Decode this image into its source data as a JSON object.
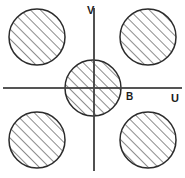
{
  "figure": {
    "background_color": "#ffffff",
    "ink_color": "#2b2b2b",
    "axis_color": "#4a4a4a",
    "hatch_angle_label": "45-degree diagonal",
    "axes": {
      "horizontal": {
        "name": "u-axis",
        "label": "U",
        "label_x": 171,
        "label_y": 99,
        "x1": 3,
        "y1": 88,
        "x2": 182,
        "y2": 88
      },
      "vertical": {
        "name": "v-axis",
        "label": "V",
        "label_x": 87,
        "label_y": 11,
        "x1": 94,
        "y1": 8,
        "x2": 94,
        "y2": 171
      }
    },
    "point_labels": [
      {
        "name": "point-b",
        "text": "B",
        "x": 126,
        "y": 97
      }
    ],
    "circles": [
      {
        "name": "circle-top-left",
        "quadrant": "top-left",
        "cx": 37,
        "cy": 37,
        "r": 28
      },
      {
        "name": "circle-top-right",
        "quadrant": "top-right",
        "cx": 148,
        "cy": 37,
        "r": 28
      },
      {
        "name": "circle-center",
        "quadrant": "origin",
        "cx": 93,
        "cy": 88,
        "r": 28
      },
      {
        "name": "circle-bottom-left",
        "quadrant": "bottom-left",
        "cx": 37,
        "cy": 140,
        "r": 28
      },
      {
        "name": "circle-bottom-right",
        "quadrant": "bottom-right",
        "cx": 148,
        "cy": 140,
        "r": 28
      }
    ]
  },
  "chart_data": {
    "type": "scatter",
    "xlabel": "U",
    "ylabel": "V",
    "grid": false,
    "legend": null,
    "annotations": [
      "B"
    ],
    "series": [
      {
        "name": "hatched-disks",
        "marker": "hatched-circle",
        "points": [
          {
            "label": "circle-top-left",
            "x": -56,
            "y": 51,
            "radius": 28
          },
          {
            "label": "circle-top-right",
            "x": 55,
            "y": 51,
            "radius": 28
          },
          {
            "label": "circle-center",
            "x": 0,
            "y": 0,
            "radius": 28
          },
          {
            "label": "circle-bottom-left",
            "x": -56,
            "y": -52,
            "radius": 28
          },
          {
            "label": "circle-bottom-right",
            "x": 55,
            "y": -52,
            "radius": 28
          }
        ]
      }
    ]
  }
}
